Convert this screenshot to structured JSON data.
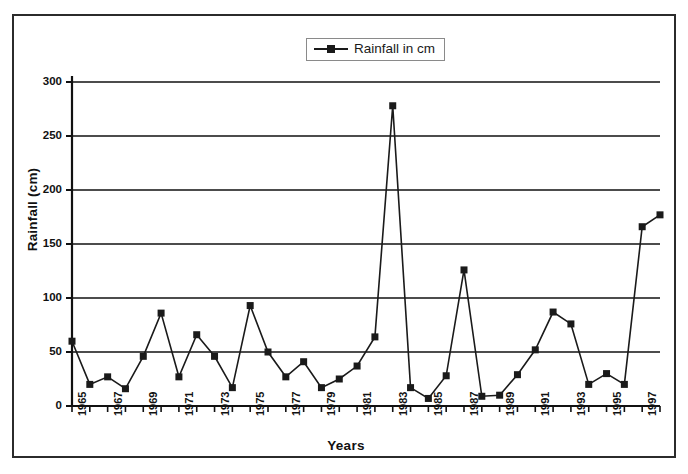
{
  "chart_data": {
    "type": "line",
    "title": "",
    "xlabel": "Years",
    "ylabel": "Rainfall (cm)",
    "ylim": [
      0,
      300
    ],
    "ytick_values": [
      0,
      50,
      100,
      150,
      200,
      250,
      300
    ],
    "ytick_labels": [
      "0",
      "50",
      "100",
      "150",
      "200",
      "250",
      "300"
    ],
    "grid": "horizontal",
    "legend_position": "top-center",
    "legend_entries": [
      "Rainfall in cm"
    ],
    "marker": "square",
    "line_color": "#1a1a1a",
    "marker_color": "#1a1a1a",
    "categories": [
      "1965",
      "1966",
      "1967",
      "1968",
      "1969",
      "1970",
      "1971",
      "1972",
      "1973",
      "1974",
      "1975",
      "1976",
      "1977",
      "1978",
      "1979",
      "1980",
      "1981",
      "1982",
      "1983",
      "1984",
      "1985",
      "1986",
      "1987",
      "1988",
      "1989",
      "1990",
      "1991",
      "1992",
      "1993",
      "1994",
      "1995",
      "1996",
      "1997",
      "1998"
    ],
    "xtick_labels_shown": [
      "1965",
      "1967",
      "1969",
      "1971",
      "1973",
      "1975",
      "1977",
      "1979",
      "1981",
      "1983",
      "1985",
      "1987",
      "1989",
      "1991",
      "1993",
      "1995",
      "1997"
    ],
    "series": [
      {
        "name": "Rainfall in cm",
        "values": [
          60,
          20,
          27,
          16,
          46,
          86,
          27,
          66,
          46,
          17,
          93,
          50,
          27,
          41,
          17,
          25,
          37,
          64,
          278,
          17,
          7,
          28,
          126,
          9,
          10,
          29,
          52,
          87,
          76,
          20,
          30,
          20,
          166,
          177
        ]
      }
    ]
  }
}
